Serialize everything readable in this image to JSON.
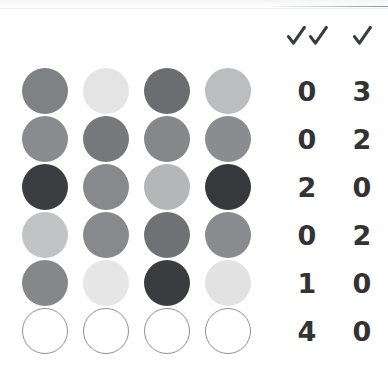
{
  "page": {
    "background_color": "#ffffff",
    "ink_color": "#333336",
    "outline_color": "#8f9094"
  },
  "header": {
    "columns": [
      {
        "id": "double-check",
        "icon": "double-check-icon",
        "label": "✓✓",
        "marks": 2
      },
      {
        "id": "single-check",
        "icon": "check-icon",
        "label": "✓",
        "marks": 1
      }
    ]
  },
  "grid": {
    "columns": 4,
    "rows": 6,
    "dot_diameter": 46,
    "column_x": [
      22,
      83,
      144,
      205
    ],
    "row_y": [
      68,
      116,
      164,
      212,
      260,
      308
    ],
    "cells": [
      [
        {
          "fill": "#808184",
          "state": "filled"
        },
        {
          "fill": "#e4e4e4",
          "state": "filled"
        },
        {
          "fill": "#6c6d70",
          "state": "filled"
        },
        {
          "fill": "#bcbdbf",
          "state": "filled"
        }
      ],
      [
        {
          "fill": "#8a8b8e",
          "state": "filled"
        },
        {
          "fill": "#77787b",
          "state": "filled"
        },
        {
          "fill": "#868789",
          "state": "filled"
        },
        {
          "fill": "#8b8c8f",
          "state": "filled"
        }
      ],
      [
        {
          "fill": "#3c3d40",
          "state": "filled"
        },
        {
          "fill": "#88898c",
          "state": "filled"
        },
        {
          "fill": "#b5b6b8",
          "state": "filled"
        },
        {
          "fill": "#37383b",
          "state": "filled"
        }
      ],
      [
        {
          "fill": "#c2c3c5",
          "state": "filled"
        },
        {
          "fill": "#88898c",
          "state": "filled"
        },
        {
          "fill": "#707174",
          "state": "filled"
        },
        {
          "fill": "#8a8b8e",
          "state": "filled"
        }
      ],
      [
        {
          "fill": "#868789",
          "state": "filled"
        },
        {
          "fill": "#e6e6e6",
          "state": "filled"
        },
        {
          "fill": "#3b3c3f",
          "state": "filled"
        },
        {
          "fill": "#e2e2e2",
          "state": "filled"
        }
      ],
      [
        {
          "fill": "#ffffff",
          "state": "empty"
        },
        {
          "fill": "#ffffff",
          "state": "empty"
        },
        {
          "fill": "#ffffff",
          "state": "empty"
        },
        {
          "fill": "#ffffff",
          "state": "empty"
        }
      ]
    ]
  },
  "scores": {
    "rows": [
      {
        "double_check": "0",
        "single_check": "3"
      },
      {
        "double_check": "0",
        "single_check": "2"
      },
      {
        "double_check": "2",
        "single_check": "0"
      },
      {
        "double_check": "0",
        "single_check": "2"
      },
      {
        "double_check": "1",
        "single_check": "0"
      },
      {
        "double_check": "4",
        "single_check": "0"
      }
    ]
  }
}
